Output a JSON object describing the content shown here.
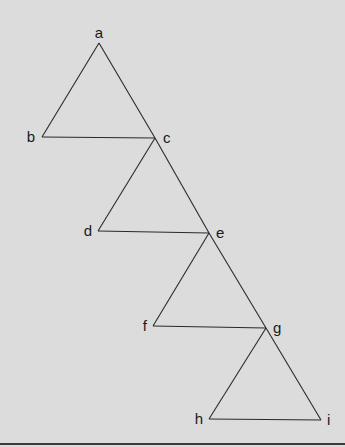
{
  "diagram": {
    "background": "#dcdcdc",
    "line_color": "#2a2a2a",
    "nodes": [
      {
        "id": "a",
        "label": "a",
        "x": 99,
        "y": 43,
        "lx": 99,
        "ly": 38,
        "anchor": "middle"
      },
      {
        "id": "b",
        "label": "b",
        "x": 42,
        "y": 137,
        "lx": 35,
        "ly": 142,
        "anchor": "end"
      },
      {
        "id": "c",
        "label": "c",
        "x": 155,
        "y": 138,
        "lx": 163,
        "ly": 143,
        "anchor": "start"
      },
      {
        "id": "d",
        "label": "d",
        "x": 98,
        "y": 231,
        "lx": 92,
        "ly": 236,
        "anchor": "end"
      },
      {
        "id": "e",
        "label": "e",
        "x": 209,
        "y": 233,
        "lx": 216,
        "ly": 238,
        "anchor": "start"
      },
      {
        "id": "f",
        "label": "f",
        "x": 153,
        "y": 326,
        "lx": 147,
        "ly": 331,
        "anchor": "end"
      },
      {
        "id": "g",
        "label": "g",
        "x": 266,
        "y": 328,
        "lx": 273,
        "ly": 333,
        "anchor": "start"
      },
      {
        "id": "h",
        "label": "h",
        "x": 209,
        "y": 419,
        "lx": 203,
        "ly": 424,
        "anchor": "end"
      },
      {
        "id": "i",
        "label": "i",
        "x": 321,
        "y": 420,
        "lx": 327,
        "ly": 425,
        "anchor": "start"
      }
    ],
    "edges": [
      [
        "a",
        "b"
      ],
      [
        "a",
        "c"
      ],
      [
        "b",
        "c"
      ],
      [
        "c",
        "d"
      ],
      [
        "c",
        "e"
      ],
      [
        "d",
        "e"
      ],
      [
        "e",
        "f"
      ],
      [
        "e",
        "g"
      ],
      [
        "f",
        "g"
      ],
      [
        "g",
        "h"
      ],
      [
        "g",
        "i"
      ],
      [
        "h",
        "i"
      ]
    ]
  }
}
